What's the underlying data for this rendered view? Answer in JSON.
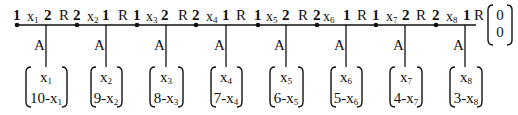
{
  "diagram": {
    "nodes": [
      {
        "id": "x1",
        "left_index": "1",
        "var": "x",
        "sub": "1",
        "right_index": "2",
        "bond": "R",
        "leg": "A",
        "vec_top": "x",
        "vec_top_sub": "1",
        "vec_bottom_prefix": "10-x",
        "vec_bottom_sub": "1"
      },
      {
        "id": "x2",
        "left_index": "2",
        "var": "x",
        "sub": "2",
        "right_index": "1",
        "bond": "R",
        "leg": "A",
        "vec_top": "x",
        "vec_top_sub": "2",
        "vec_bottom_prefix": "9-x",
        "vec_bottom_sub": "2"
      },
      {
        "id": "x3",
        "left_index": "1",
        "var": "x",
        "sub": "3",
        "right_index": "2",
        "bond": "R",
        "leg": "A",
        "vec_top": "x",
        "vec_top_sub": "3",
        "vec_bottom_prefix": "8-x",
        "vec_bottom_sub": "3"
      },
      {
        "id": "x4",
        "left_index": "2",
        "var": "x",
        "sub": "4",
        "right_index": "1",
        "bond": "R",
        "leg": "A",
        "vec_top": "x",
        "vec_top_sub": "4",
        "vec_bottom_prefix": "7-x",
        "vec_bottom_sub": "4"
      },
      {
        "id": "x5",
        "left_index": "1",
        "var": "x",
        "sub": "5",
        "right_index": "2",
        "bond": "R",
        "leg": "A",
        "vec_top": "x",
        "vec_top_sub": "5",
        "vec_bottom_prefix": "6-x",
        "vec_bottom_sub": "5"
      },
      {
        "id": "x6",
        "left_index": "2",
        "var": "x",
        "sub": "6",
        "right_index": "1",
        "bond": "R",
        "leg": "A",
        "vec_top": "x",
        "vec_top_sub": "6",
        "vec_bottom_prefix": "5-x",
        "vec_bottom_sub": "6"
      },
      {
        "id": "x7",
        "left_index": "1",
        "var": "x",
        "sub": "7",
        "right_index": "2",
        "bond": "R",
        "leg": "A",
        "vec_top": "x",
        "vec_top_sub": "7",
        "vec_bottom_prefix": "4-x",
        "vec_bottom_sub": "7"
      },
      {
        "id": "x8",
        "left_index": "2",
        "var": "x",
        "sub": "8",
        "right_index": "1",
        "bond": "R",
        "leg": "A",
        "vec_top": "x",
        "vec_top_sub": "8",
        "vec_bottom_prefix": "3-x",
        "vec_bottom_sub": "8"
      }
    ],
    "terminal_vector": {
      "top": "0",
      "bottom": "0"
    },
    "colors": {
      "ink": "#111111",
      "background": "#ffffff"
    }
  }
}
